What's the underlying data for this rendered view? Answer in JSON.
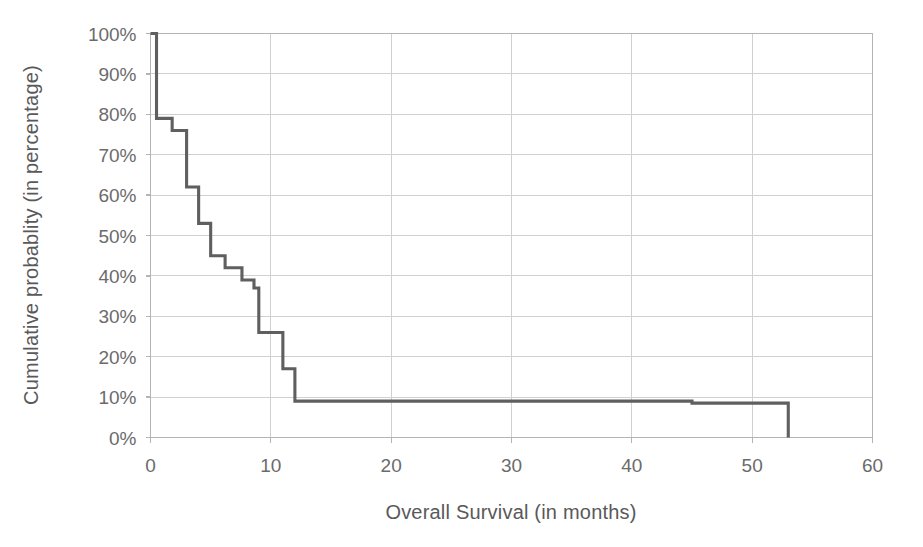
{
  "chart_data": {
    "type": "line",
    "subtype": "kaplan-meier-step",
    "title": "",
    "xlabel": "Overall Survival (in months)",
    "ylabel": "Cumulative probablity (in percentage)",
    "xlim": [
      0,
      60
    ],
    "ylim": [
      0,
      100
    ],
    "xticks": [
      0,
      10,
      20,
      30,
      40,
      50,
      60
    ],
    "xtick_labels": [
      "0",
      "10",
      "20",
      "30",
      "40",
      "50",
      "60"
    ],
    "yticks": [
      0,
      10,
      20,
      30,
      40,
      50,
      60,
      70,
      80,
      90,
      100
    ],
    "ytick_labels": [
      "0%",
      "10%",
      "20%",
      "30%",
      "40%",
      "50%",
      "60%",
      "70%",
      "80%",
      "90%",
      "100%"
    ],
    "grid": "horizontal-and-vertical",
    "legend": "none",
    "series": [
      {
        "name": "Overall survival",
        "color": "#5f5f5f",
        "x": [
          0,
          0.5,
          0.5,
          1.8,
          1.8,
          3.0,
          3.0,
          4.0,
          4.0,
          5.0,
          5.0,
          6.2,
          6.2,
          7.6,
          7.6,
          8.6,
          8.6,
          9.0,
          9.0,
          11.0,
          11.0,
          12.0,
          12.0,
          45.0,
          45.0,
          53.0,
          53.0
        ],
        "y": [
          100,
          100,
          79,
          79,
          76,
          76,
          62,
          62,
          53,
          53,
          45,
          45,
          42,
          42,
          39,
          39,
          37,
          37,
          26,
          26,
          17,
          17,
          9,
          9,
          8.5,
          8.5,
          0
        ]
      }
    ],
    "annotations": []
  },
  "axes": {
    "x_title": "Overall Survival (in months)",
    "y_title": "Cumulative probablity (in percentage)"
  },
  "colors": {
    "curve": "#5f5f5f",
    "grid": "#d0d0d0",
    "frame": "#b4b4b4",
    "text": "#595959",
    "background": "#ffffff"
  }
}
